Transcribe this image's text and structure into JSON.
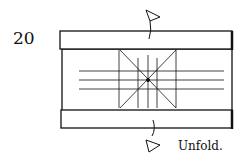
{
  "diagram": {
    "step_number": "20",
    "caption": "Unfold.",
    "colors": {
      "line": "#111111",
      "background": "#ffffff"
    },
    "arrows": [
      {
        "name": "unfold-top-flap",
        "direction": "up"
      },
      {
        "name": "unfold-bottom-flap",
        "direction": "down"
      }
    ]
  }
}
